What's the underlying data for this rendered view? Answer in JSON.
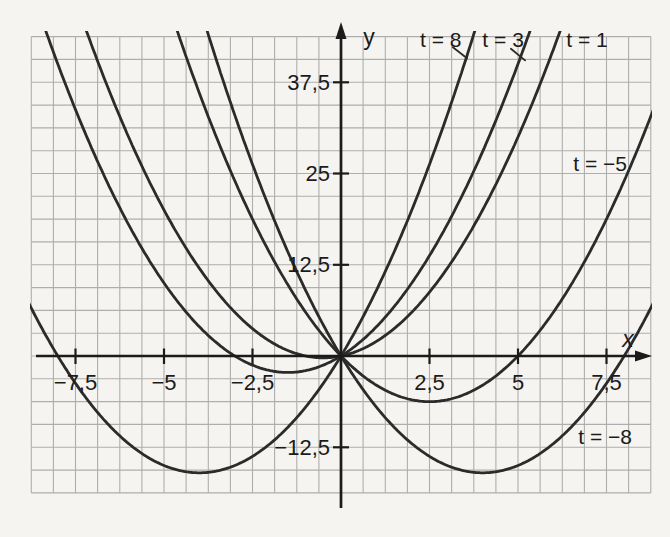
{
  "figure": {
    "background": "#f5f4f0",
    "grid_color": "#aeaeae",
    "axis_color": "#1b1b1b",
    "curve_color": "#2b2b2b",
    "text_color": "#1b1b1b"
  },
  "chart_data": {
    "type": "line",
    "title": "",
    "equation": "y = x^2 + t*x",
    "xlabel": "x",
    "ylabel": "y",
    "xlim": [
      -8.78,
      8.8
    ],
    "ylim": [
      -20.8,
      45.6
    ],
    "grid": {
      "on": true,
      "x_step": 0.625,
      "y_step": 3.125,
      "x_range": [
        -8.75,
        8.75
      ],
      "y_range": [
        -18.75,
        43.75
      ]
    },
    "x_ticks": [
      {
        "value": -7.5,
        "label": "−7,5"
      },
      {
        "value": -5,
        "label": "−5"
      },
      {
        "value": -2.5,
        "label": "−2,5"
      },
      {
        "value": 2.5,
        "label": "2,5"
      },
      {
        "value": 5,
        "label": "5"
      },
      {
        "value": 7.5,
        "label": "7,5"
      }
    ],
    "y_ticks": [
      {
        "value": 37.5,
        "label": "37,5"
      },
      {
        "value": 25,
        "label": "25"
      },
      {
        "value": 12.5,
        "label": "12,5"
      },
      {
        "value": -12.5,
        "label": "−12,5"
      }
    ],
    "series": [
      {
        "name": "t = 8",
        "t": 8,
        "vertex": {
          "x": -4,
          "y": -16
        },
        "label": {
          "text": "t = 8",
          "x": 2.82,
          "y": 43.3,
          "leader": [
            [
              3.16,
              42.3
            ],
            [
              3.56,
              40.8
            ]
          ]
        }
      },
      {
        "name": "t = 3",
        "t": 3,
        "vertex": {
          "x": -1.5,
          "y": -2.25
        },
        "label": {
          "text": "t = 3",
          "x": 4.58,
          "y": 43.3,
          "leader": [
            [
              4.8,
              42.1
            ],
            [
              5.2,
              40.5
            ]
          ]
        }
      },
      {
        "name": "t = 1",
        "t": 1,
        "vertex": {
          "x": -0.5,
          "y": -0.25
        },
        "label": {
          "text": "t = 1",
          "x": 6.95,
          "y": 43.3
        }
      },
      {
        "name": "t = −5",
        "t": -5,
        "vertex": {
          "x": 2.5,
          "y": -6.25
        },
        "label": {
          "text": "t = −5",
          "x": 7.32,
          "y": 26.3
        }
      },
      {
        "name": "t = −8",
        "t": -8,
        "vertex": {
          "x": 4,
          "y": -16
        },
        "label": {
          "text": "t = −8",
          "x": 7.46,
          "y": -11.1
        }
      }
    ]
  }
}
